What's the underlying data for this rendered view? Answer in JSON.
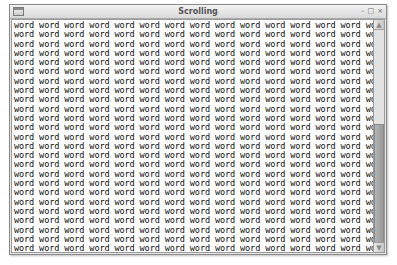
{
  "window": {
    "title": "Scrolling",
    "controls": {
      "minimize": "–",
      "maximize": "□",
      "close": "×"
    }
  },
  "content": {
    "word": "word",
    "words_per_row": 16,
    "visible_rows": 25
  },
  "scrollbar": {
    "up_arrow": "▲",
    "down_arrow": "▼",
    "thumb_position_pct": 45,
    "thumb_size_pct": 56
  }
}
